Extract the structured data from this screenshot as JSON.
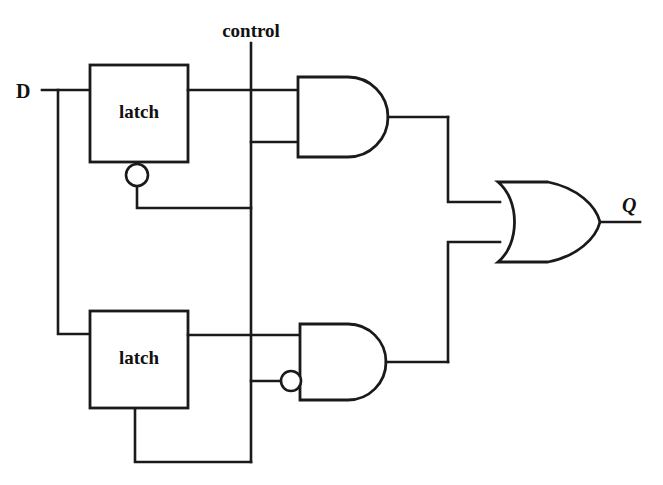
{
  "diagram": {
    "background_color": "#ffffff",
    "line_color": "#1a1a1a",
    "signals": {
      "input_d": "D",
      "input_control": "control",
      "output_q": "Q"
    },
    "blocks": [
      {
        "id": "latch-top",
        "label": "latch",
        "x": 90,
        "y": 65,
        "width": 98,
        "height": 97,
        "enable_inverted": true
      },
      {
        "id": "latch-bottom",
        "label": "latch",
        "x": 90,
        "y": 311,
        "width": 98,
        "height": 97,
        "enable_inverted": false
      }
    ],
    "gates": [
      {
        "id": "and-gate-top",
        "type": "and",
        "inputs_inverted": [
          false,
          false
        ],
        "x": 298,
        "y": 77,
        "width": 102,
        "height": 80
      },
      {
        "id": "and-gate-bottom",
        "type": "and",
        "inputs_inverted": [
          false,
          true
        ],
        "x": 300,
        "y": 324,
        "width": 100,
        "height": 76
      },
      {
        "id": "or-gate",
        "type": "or",
        "inputs_inverted": [
          false,
          false
        ],
        "x": 498,
        "y": 182,
        "width": 102,
        "height": 80
      }
    ],
    "nets": [
      {
        "id": "net-d-fanout",
        "from": "D",
        "to": [
          "latch-top.data",
          "latch-bottom.data"
        ]
      },
      {
        "id": "net-control-fanout",
        "from": "control",
        "to": [
          "and-gate-top.in2",
          "and-gate-bottom.in2",
          "latch-top.enable",
          "latch-bottom.enable"
        ]
      },
      {
        "id": "net-latch-top-out",
        "from": "latch-top.out",
        "to": [
          "and-gate-top.in1"
        ]
      },
      {
        "id": "net-latch-bottom-out",
        "from": "latch-bottom.out",
        "to": [
          "and-gate-bottom.in1"
        ]
      },
      {
        "id": "net-and-top-out",
        "from": "and-gate-top.out",
        "to": [
          "or-gate.in1"
        ]
      },
      {
        "id": "net-and-bottom-out",
        "from": "and-gate-bottom.out",
        "to": [
          "or-gate.in2"
        ]
      },
      {
        "id": "net-or-out",
        "from": "or-gate.out",
        "to": [
          "Q"
        ]
      }
    ]
  }
}
